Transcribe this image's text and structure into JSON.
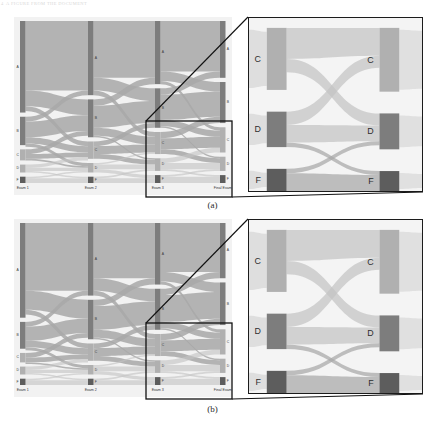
{
  "figure": {
    "header_number": "4",
    "header_note": "A FIGURE FROM THE DOCUMENT",
    "caption_a": "(a)",
    "caption_b": "(b)",
    "panel_a_name": "sankey-panel-a",
    "panel_b_name": "sankey-panel-b"
  },
  "colors": {
    "plot_background": "#f2f2f2",
    "inset_background": "#f4f4f4",
    "ribbon": "#a8a8a8",
    "ribbon_light": "#c4c4c4",
    "node_bar": "#7d7d7d",
    "node_bar_dark": "#5d5d5d",
    "node_bar_light": "#b0b0b0",
    "inset_border": "#1c1c1c",
    "connector_line": "#111111",
    "text": "#333333"
  },
  "chart_data": {
    "type": "sankey",
    "title": "",
    "subtitle": "",
    "xlabel": "",
    "ylabel": "",
    "grid": false,
    "legend_position": "none",
    "stage_labels": [
      "Exam 1",
      "Exam 2",
      "Exam 3",
      "Final Exam"
    ],
    "grade_labels": [
      "A",
      "B",
      "C",
      "D",
      "F"
    ],
    "inset_grade_labels": [
      "C",
      "D",
      "F"
    ],
    "inset_stage_labels": [
      "Exam 3",
      "Final Exam"
    ],
    "panels": [
      {
        "id": "a",
        "caption": "(a)",
        "nodes": [
          {
            "stage": 0,
            "grade": "A",
            "value": 58
          },
          {
            "stage": 0,
            "grade": "B",
            "value": 18
          },
          {
            "stage": 0,
            "grade": "C",
            "value": 7
          },
          {
            "stage": 0,
            "grade": "D",
            "value": 5
          },
          {
            "stage": 0,
            "grade": "F",
            "value": 4
          },
          {
            "stage": 1,
            "grade": "A",
            "value": 47
          },
          {
            "stage": 1,
            "grade": "B",
            "value": 24
          },
          {
            "stage": 1,
            "grade": "C",
            "value": 11
          },
          {
            "stage": 1,
            "grade": "D",
            "value": 6
          },
          {
            "stage": 1,
            "grade": "F",
            "value": 4
          },
          {
            "stage": 2,
            "grade": "A",
            "value": 40
          },
          {
            "stage": 2,
            "grade": "B",
            "value": 25
          },
          {
            "stage": 2,
            "grade": "C",
            "value": 14
          },
          {
            "stage": 2,
            "grade": "D",
            "value": 8
          },
          {
            "stage": 2,
            "grade": "F",
            "value": 5
          },
          {
            "stage": 3,
            "grade": "A",
            "value": 36
          },
          {
            "stage": 3,
            "grade": "B",
            "value": 26
          },
          {
            "stage": 3,
            "grade": "C",
            "value": 16
          },
          {
            "stage": 3,
            "grade": "D",
            "value": 9
          },
          {
            "stage": 3,
            "grade": "F",
            "value": 5
          }
        ],
        "links": [
          {
            "from_stage": 0,
            "from": "A",
            "to": "A",
            "value": 44
          },
          {
            "from_stage": 0,
            "from": "A",
            "to": "B",
            "value": 10
          },
          {
            "from_stage": 0,
            "from": "A",
            "to": "C",
            "value": 3
          },
          {
            "from_stage": 0,
            "from": "B",
            "to": "A",
            "value": 3
          },
          {
            "from_stage": 0,
            "from": "B",
            "to": "B",
            "value": 10
          },
          {
            "from_stage": 0,
            "from": "B",
            "to": "C",
            "value": 4
          },
          {
            "from_stage": 0,
            "from": "B",
            "to": "D",
            "value": 2
          },
          {
            "from_stage": 0,
            "from": "C",
            "to": "B",
            "value": 3
          },
          {
            "from_stage": 0,
            "from": "C",
            "to": "C",
            "value": 3
          },
          {
            "from_stage": 0,
            "from": "C",
            "to": "D",
            "value": 1
          },
          {
            "from_stage": 0,
            "from": "D",
            "to": "C",
            "value": 2
          },
          {
            "from_stage": 0,
            "from": "D",
            "to": "D",
            "value": 2
          },
          {
            "from_stage": 0,
            "from": "D",
            "to": "F",
            "value": 1
          },
          {
            "from_stage": 0,
            "from": "F",
            "to": "D",
            "value": 1
          },
          {
            "from_stage": 0,
            "from": "F",
            "to": "F",
            "value": 3
          },
          {
            "from_stage": 1,
            "from": "A",
            "to": "A",
            "value": 36
          },
          {
            "from_stage": 1,
            "from": "A",
            "to": "B",
            "value": 8
          },
          {
            "from_stage": 1,
            "from": "A",
            "to": "C",
            "value": 3
          },
          {
            "from_stage": 1,
            "from": "B",
            "to": "A",
            "value": 4
          },
          {
            "from_stage": 1,
            "from": "B",
            "to": "B",
            "value": 14
          },
          {
            "from_stage": 1,
            "from": "B",
            "to": "C",
            "value": 5
          },
          {
            "from_stage": 1,
            "from": "B",
            "to": "D",
            "value": 1
          },
          {
            "from_stage": 1,
            "from": "C",
            "to": "B",
            "value": 3
          },
          {
            "from_stage": 1,
            "from": "C",
            "to": "C",
            "value": 5
          },
          {
            "from_stage": 1,
            "from": "C",
            "to": "D",
            "value": 3
          },
          {
            "from_stage": 1,
            "from": "D",
            "to": "C",
            "value": 1
          },
          {
            "from_stage": 1,
            "from": "D",
            "to": "D",
            "value": 3
          },
          {
            "from_stage": 1,
            "from": "D",
            "to": "F",
            "value": 2
          },
          {
            "from_stage": 1,
            "from": "F",
            "to": "D",
            "value": 1
          },
          {
            "from_stage": 1,
            "from": "F",
            "to": "F",
            "value": 3
          },
          {
            "from_stage": 2,
            "from": "A",
            "to": "A",
            "value": 32
          },
          {
            "from_stage": 2,
            "from": "A",
            "to": "B",
            "value": 6
          },
          {
            "from_stage": 2,
            "from": "A",
            "to": "C",
            "value": 2
          },
          {
            "from_stage": 2,
            "from": "B",
            "to": "A",
            "value": 4
          },
          {
            "from_stage": 2,
            "from": "B",
            "to": "B",
            "value": 16
          },
          {
            "from_stage": 2,
            "from": "B",
            "to": "C",
            "value": 4
          },
          {
            "from_stage": 2,
            "from": "B",
            "to": "D",
            "value": 1
          },
          {
            "from_stage": 2,
            "from": "C",
            "to": "B",
            "value": 4
          },
          {
            "from_stage": 2,
            "from": "C",
            "to": "C",
            "value": 7
          },
          {
            "from_stage": 2,
            "from": "C",
            "to": "D",
            "value": 3
          },
          {
            "from_stage": 2,
            "from": "D",
            "to": "C",
            "value": 3
          },
          {
            "from_stage": 2,
            "from": "D",
            "to": "D",
            "value": 4
          },
          {
            "from_stage": 2,
            "from": "D",
            "to": "F",
            "value": 1
          },
          {
            "from_stage": 2,
            "from": "F",
            "to": "D",
            "value": 1
          },
          {
            "from_stage": 2,
            "from": "F",
            "to": "F",
            "value": 4
          }
        ],
        "inset_region": {
          "stage_from": 2,
          "stage_to": 3,
          "grades": [
            "C",
            "D",
            "F"
          ]
        }
      },
      {
        "id": "b",
        "caption": "(b)",
        "nodes": [
          {
            "stage": 0,
            "grade": "A",
            "value": 60
          },
          {
            "stage": 0,
            "grade": "B",
            "value": 17
          },
          {
            "stage": 0,
            "grade": "C",
            "value": 6
          },
          {
            "stage": 0,
            "grade": "D",
            "value": 5
          },
          {
            "stage": 0,
            "grade": "F",
            "value": 4
          },
          {
            "stage": 1,
            "grade": "A",
            "value": 46
          },
          {
            "stage": 1,
            "grade": "B",
            "value": 25
          },
          {
            "stage": 1,
            "grade": "C",
            "value": 11
          },
          {
            "stage": 1,
            "grade": "D",
            "value": 6
          },
          {
            "stage": 1,
            "grade": "F",
            "value": 4
          },
          {
            "stage": 2,
            "grade": "A",
            "value": 39
          },
          {
            "stage": 2,
            "grade": "B",
            "value": 26
          },
          {
            "stage": 2,
            "grade": "C",
            "value": 14
          },
          {
            "stage": 2,
            "grade": "D",
            "value": 8
          },
          {
            "stage": 2,
            "grade": "F",
            "value": 5
          },
          {
            "stage": 3,
            "grade": "A",
            "value": 35
          },
          {
            "stage": 3,
            "grade": "B",
            "value": 27
          },
          {
            "stage": 3,
            "grade": "C",
            "value": 16
          },
          {
            "stage": 3,
            "grade": "D",
            "value": 9
          },
          {
            "stage": 3,
            "grade": "F",
            "value": 5
          }
        ],
        "links": [
          {
            "from_stage": 0,
            "from": "A",
            "to": "A",
            "value": 43
          },
          {
            "from_stage": 0,
            "from": "A",
            "to": "B",
            "value": 12
          },
          {
            "from_stage": 0,
            "from": "A",
            "to": "C",
            "value": 3
          },
          {
            "from_stage": 0,
            "from": "B",
            "to": "A",
            "value": 3
          },
          {
            "from_stage": 0,
            "from": "B",
            "to": "B",
            "value": 9
          },
          {
            "from_stage": 0,
            "from": "B",
            "to": "C",
            "value": 4
          },
          {
            "from_stage": 0,
            "from": "B",
            "to": "D",
            "value": 2
          },
          {
            "from_stage": 0,
            "from": "C",
            "to": "B",
            "value": 3
          },
          {
            "from_stage": 0,
            "from": "C",
            "to": "C",
            "value": 3
          },
          {
            "from_stage": 0,
            "from": "C",
            "to": "D",
            "value": 1
          },
          {
            "from_stage": 0,
            "from": "D",
            "to": "C",
            "value": 2
          },
          {
            "from_stage": 0,
            "from": "D",
            "to": "D",
            "value": 2
          },
          {
            "from_stage": 0,
            "from": "D",
            "to": "F",
            "value": 1
          },
          {
            "from_stage": 0,
            "from": "F",
            "to": "D",
            "value": 1
          },
          {
            "from_stage": 0,
            "from": "F",
            "to": "F",
            "value": 3
          },
          {
            "from_stage": 1,
            "from": "A",
            "to": "A",
            "value": 35
          },
          {
            "from_stage": 1,
            "from": "A",
            "to": "B",
            "value": 8
          },
          {
            "from_stage": 1,
            "from": "A",
            "to": "C",
            "value": 3
          },
          {
            "from_stage": 1,
            "from": "B",
            "to": "A",
            "value": 4
          },
          {
            "from_stage": 1,
            "from": "B",
            "to": "B",
            "value": 15
          },
          {
            "from_stage": 1,
            "from": "B",
            "to": "C",
            "value": 5
          },
          {
            "from_stage": 1,
            "from": "B",
            "to": "D",
            "value": 1
          },
          {
            "from_stage": 1,
            "from": "C",
            "to": "B",
            "value": 3
          },
          {
            "from_stage": 1,
            "from": "C",
            "to": "C",
            "value": 5
          },
          {
            "from_stage": 1,
            "from": "C",
            "to": "D",
            "value": 3
          },
          {
            "from_stage": 1,
            "from": "D",
            "to": "C",
            "value": 1
          },
          {
            "from_stage": 1,
            "from": "D",
            "to": "D",
            "value": 3
          },
          {
            "from_stage": 1,
            "from": "D",
            "to": "F",
            "value": 2
          },
          {
            "from_stage": 1,
            "from": "F",
            "to": "D",
            "value": 1
          },
          {
            "from_stage": 1,
            "from": "F",
            "to": "F",
            "value": 3
          },
          {
            "from_stage": 2,
            "from": "A",
            "to": "A",
            "value": 31
          },
          {
            "from_stage": 2,
            "from": "A",
            "to": "B",
            "value": 6
          },
          {
            "from_stage": 2,
            "from": "A",
            "to": "C",
            "value": 2
          },
          {
            "from_stage": 2,
            "from": "B",
            "to": "A",
            "value": 4
          },
          {
            "from_stage": 2,
            "from": "B",
            "to": "B",
            "value": 17
          },
          {
            "from_stage": 2,
            "from": "B",
            "to": "C",
            "value": 4
          },
          {
            "from_stage": 2,
            "from": "B",
            "to": "D",
            "value": 1
          },
          {
            "from_stage": 2,
            "from": "C",
            "to": "B",
            "value": 4
          },
          {
            "from_stage": 2,
            "from": "C",
            "to": "C",
            "value": 7
          },
          {
            "from_stage": 2,
            "from": "C",
            "to": "D",
            "value": 3
          },
          {
            "from_stage": 2,
            "from": "D",
            "to": "C",
            "value": 3
          },
          {
            "from_stage": 2,
            "from": "D",
            "to": "D",
            "value": 4
          },
          {
            "from_stage": 2,
            "from": "D",
            "to": "F",
            "value": 1
          },
          {
            "from_stage": 2,
            "from": "F",
            "to": "D",
            "value": 1
          },
          {
            "from_stage": 2,
            "from": "F",
            "to": "F",
            "value": 4
          }
        ],
        "inset_region": {
          "stage_from": 2,
          "stage_to": 3,
          "grades": [
            "C",
            "D",
            "F"
          ]
        }
      }
    ]
  }
}
